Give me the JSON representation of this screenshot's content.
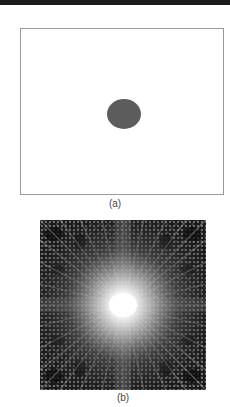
{
  "figure": {
    "panel_a": {
      "caption": "(a)",
      "description": "Blank rectangular frame with a single dark gray elliptical spot at its center",
      "spot_color": "#5c5c5c",
      "frame_color": "#9a9a9a"
    },
    "panel_b": {
      "caption": "(b)",
      "description": "Square diffraction/interference pattern: bright white center with radial streaks fading to dark textured lattice at the edges",
      "center_color": "#ffffff",
      "edge_color": "#1a1a1a"
    }
  }
}
